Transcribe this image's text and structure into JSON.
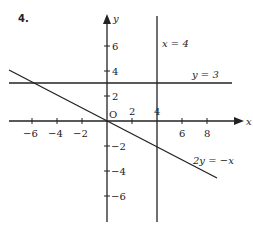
{
  "question_number": "4.",
  "axes": {
    "x_label": "x",
    "y_label": "y",
    "origin_label": "O",
    "x_ticks": [
      {
        "value": -6,
        "label": "−6"
      },
      {
        "value": -4,
        "label": "−4"
      },
      {
        "value": -2,
        "label": "−2"
      },
      {
        "value": 2,
        "label": "2"
      },
      {
        "value": 4,
        "label": "4"
      },
      {
        "value": 6,
        "label": "6"
      },
      {
        "value": 8,
        "label": "8"
      }
    ],
    "y_ticks": [
      {
        "value": 6,
        "label": "6"
      },
      {
        "value": 4,
        "label": "4"
      },
      {
        "value": 2,
        "label": "2"
      },
      {
        "value": -2,
        "label": "−2"
      },
      {
        "value": -4,
        "label": "−4"
      },
      {
        "value": -6,
        "label": "−6"
      }
    ]
  },
  "lines": [
    {
      "equation": "x = 4",
      "type": "vertical",
      "x": 4
    },
    {
      "equation": "y = 3",
      "type": "horizontal",
      "y": 3
    },
    {
      "equation": "2y = −x",
      "type": "slope",
      "slope": -0.5,
      "intercept": 0
    }
  ],
  "labels": {
    "line_x4": "x = 4",
    "line_y3": "y = 3",
    "line_2y": "2y = −x"
  },
  "tick_labels": {
    "xn6": "−6",
    "xn4": "−4",
    "xn2": "−2",
    "x2": "2",
    "x4": "4",
    "x6": "6",
    "x8": "8",
    "y6": "6",
    "y4": "4",
    "y2": "2",
    "yn2": "−2",
    "yn4": "−4",
    "yn6": "−6"
  }
}
